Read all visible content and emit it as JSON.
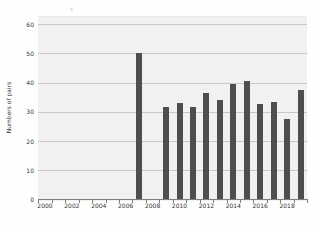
{
  "chart_data": {
    "type": "bar",
    "title": "",
    "xlabel": "",
    "ylabel": "Numbers of pairs",
    "x": [
      2007,
      2009,
      2010,
      2011,
      2012,
      2013,
      2014,
      2015,
      2016,
      2017,
      2018,
      2019
    ],
    "values": [
      50,
      31.5,
      33,
      31.5,
      36.5,
      34,
      39.5,
      40.5,
      32.5,
      33.5,
      27.5,
      37.5
    ],
    "x_axis": {
      "tick_labels": [
        "2000",
        "2002",
        "2004",
        "2006",
        "2008",
        "2010",
        "2012",
        "2014",
        "2016",
        "2018"
      ],
      "tick_label_years": [
        2000,
        2002,
        2004,
        2006,
        2008,
        2010,
        2012,
        2014,
        2016,
        2018
      ],
      "category_range": [
        2000,
        2019
      ]
    },
    "y_axis": {
      "ticks": [
        0,
        10,
        20,
        30,
        40,
        50,
        60
      ],
      "range": [
        0,
        60
      ]
    },
    "grid": true,
    "legend": false,
    "colors": {
      "bar": "#4e4e4e",
      "plot_background": "#f2f1ef",
      "gridline": "#c9c8c6",
      "axis": "#7d7d7b",
      "text": "#333331"
    }
  }
}
